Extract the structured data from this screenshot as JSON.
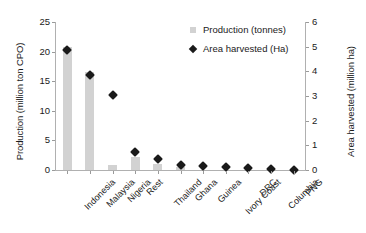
{
  "chart_data": {
    "type": "bar",
    "title": "",
    "categories": [
      "Indonesia",
      "Malaysia",
      "Nigeria",
      "Rest",
      "Thailand",
      "Ghana",
      "Guinea",
      "Ivory Coast",
      "DRC",
      "Columbia",
      "PNG"
    ],
    "series": [
      {
        "name": "Production (tonnes)",
        "axis": "left",
        "render": "bar",
        "color": "#d2d2d2",
        "values": [
          20.8,
          16.6,
          0.9,
          2.2,
          1.1,
          0.5,
          0.0,
          0.0,
          0.0,
          0.0,
          0.0
        ]
      },
      {
        "name": "Area harvested (Ha)",
        "axis": "right",
        "render": "scatter",
        "color": "#1a1a1a",
        "values": [
          5.0,
          4.0,
          3.2,
          0.88,
          0.57,
          0.36,
          0.31,
          0.26,
          0.21,
          0.17,
          0.14
        ]
      }
    ],
    "xlabel": "",
    "ylabel": "Production (million ton CPO)",
    "ylabel_right": "Area harvested (million ha)",
    "ylim": [
      0,
      25
    ],
    "ylim_right": [
      0,
      6
    ],
    "yticks": [
      0,
      5,
      10,
      15,
      20,
      25
    ],
    "yticks_right": [
      0,
      1,
      2,
      3,
      4,
      5,
      6
    ],
    "grid": false,
    "legend_position": "top-right"
  },
  "axes": {
    "left_title": "Production (million ton CPO)",
    "right_title": "Area harvested (million ha)",
    "left_ticks": [
      "0",
      "5",
      "10",
      "15",
      "20",
      "25"
    ],
    "right_ticks": [
      "0",
      "1",
      "2",
      "3",
      "4",
      "5",
      "6"
    ]
  },
  "legend": {
    "items": [
      {
        "label": "Production (tonnes)",
        "icon": "square-swatch-icon"
      },
      {
        "label": "Area harvested (Ha)",
        "icon": "diamond-swatch-icon"
      }
    ]
  }
}
